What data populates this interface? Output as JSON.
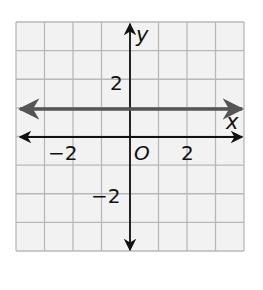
{
  "chart_data": {
    "type": "line",
    "title": "",
    "xlabel": "x",
    "ylabel": "y",
    "xlim": [
      -4,
      4
    ],
    "ylim": [
      -4,
      4
    ],
    "grid": true,
    "grid_step": 1,
    "origin_label": "O",
    "x_tick_labels": [
      {
        "value": -2,
        "label": "−2"
      },
      {
        "value": 2,
        "label": "2"
      }
    ],
    "y_tick_labels": [
      {
        "value": 2,
        "label": "2"
      },
      {
        "value": -2,
        "label": "−2"
      }
    ],
    "series": [
      {
        "name": "horizontal line y = 1",
        "equation": "y = 1",
        "points": [
          [
            -4,
            1
          ],
          [
            4,
            1
          ]
        ],
        "color": "#555555",
        "arrows": "both"
      }
    ]
  },
  "colors": {
    "background": "#ffffff",
    "grid_fill": "#f2f2f2",
    "grid_line": "#b8b8b8",
    "axis": "#111111",
    "line": "#555555"
  },
  "labels": {
    "x_axis": "x",
    "y_axis": "y",
    "origin": "O",
    "x_neg2": "−2",
    "x_pos2": "2",
    "y_pos2": "2",
    "y_neg2": "−2"
  }
}
